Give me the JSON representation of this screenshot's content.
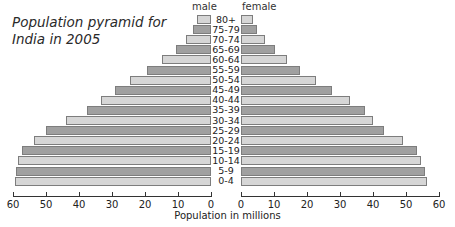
{
  "chart_data": {
    "type": "bar",
    "subtype": "population_pyramid",
    "title": "Population pyramid for India in 2005",
    "xlabel": "Population in millions",
    "ylabel": "",
    "categories": [
      "80+",
      "75-79",
      "70-74",
      "65-69",
      "60-64",
      "55-59",
      "50-54",
      "45-49",
      "40-44",
      "35-39",
      "30-34",
      "25-29",
      "20-24",
      "15-19",
      "10-14",
      "5-9",
      "0-4"
    ],
    "series": [
      {
        "name": "male",
        "values": [
          4.2,
          5.5,
          7.6,
          10.6,
          14.8,
          19.4,
          24.5,
          29.0,
          33.3,
          37.6,
          44.0,
          50.0,
          53.6,
          57.3,
          58.5,
          59.0,
          59.4
        ]
      },
      {
        "name": "female",
        "values": [
          3.6,
          4.8,
          7.3,
          10.3,
          13.9,
          17.9,
          22.7,
          27.6,
          33.0,
          37.6,
          40.0,
          43.3,
          49.0,
          53.3,
          54.5,
          55.8,
          56.4
        ]
      }
    ],
    "xlim": [
      0,
      60
    ],
    "xticks": [
      0,
      10,
      20,
      30,
      40,
      50,
      60
    ],
    "grid": false,
    "legend": "side labels above each half (male left, female right)",
    "colors": {
      "light": "#d6d6d6",
      "dark": "#a0a0a0",
      "border": "#7d7d7d"
    }
  },
  "labels": {
    "title": "Population pyramid for India in 2005",
    "male": "male",
    "female": "female",
    "xlabel": "Population in millions"
  },
  "left_ticks": [
    "60",
    "50",
    "40",
    "30",
    "20",
    "10",
    "0"
  ],
  "right_ticks": [
    "0",
    "10",
    "20",
    "30",
    "40",
    "50",
    "60"
  ]
}
